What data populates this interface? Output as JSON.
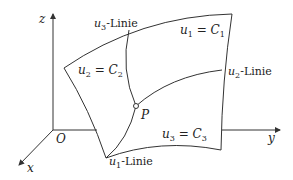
{
  "diagram": {
    "axes": {
      "z_label": "z",
      "y_label": "y",
      "x_label": "x",
      "origin_label": "O"
    },
    "surface_labels": {
      "u1_const": {
        "var": "u",
        "sub": "1",
        "eq": " = ",
        "const": "C",
        "csub": "1"
      },
      "u2_const": {
        "var": "u",
        "sub": "2",
        "eq": " = ",
        "const": "C",
        "csub": "2"
      },
      "u3_const": {
        "var": "u",
        "sub": "3",
        "eq": " = ",
        "const": "C",
        "csub": "3"
      }
    },
    "curve_labels": {
      "u1_line": {
        "var": "u",
        "sub": "1",
        "suffix": "-Linie"
      },
      "u2_line": {
        "var": "u",
        "sub": "2",
        "suffix": "-Linie"
      },
      "u3_line": {
        "var": "u",
        "sub": "3",
        "suffix": "-Linie"
      }
    },
    "point_label": "P",
    "colors": {
      "stroke": "#333333",
      "text": "#222222",
      "background": "#ffffff"
    }
  }
}
